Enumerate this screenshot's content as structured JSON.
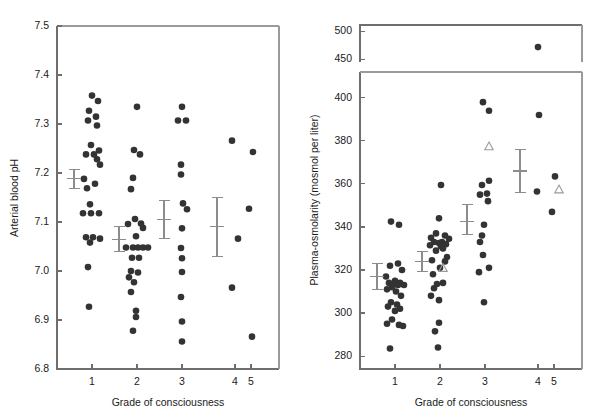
{
  "figure": {
    "panels": [
      "arterial-blood-ph",
      "plasma-osmolarity"
    ]
  },
  "chart_data": [
    {
      "type": "scatter",
      "id": "arterial-blood-ph",
      "title": "",
      "xlabel": "Grade of consciousness",
      "ylabel": "Arterial blood pH",
      "xlim": [
        0.45,
        5.75
      ],
      "ylim": [
        6.8,
        7.5
      ],
      "grid": false,
      "legend": null,
      "x_ticks": [
        1,
        2,
        3,
        4,
        5
      ],
      "x_ticklabels": [
        "1",
        "2",
        "3",
        "4",
        "5"
      ],
      "y_ticks": [
        6.8,
        6.9,
        7.0,
        7.1,
        7.2,
        7.3,
        7.4,
        7.5
      ],
      "y_ticklabels": [
        "6.8",
        "6.9",
        "7.0",
        "7.1",
        "7.2",
        "7.3",
        "7.4",
        "7.5"
      ],
      "series": [
        {
          "name": "Grade 1",
          "marker": "filled-circle",
          "x": 1,
          "values": [
            7.358,
            7.347,
            7.327,
            7.315,
            7.307,
            7.297,
            7.257,
            7.246,
            7.238,
            7.238,
            7.228,
            7.217,
            7.188,
            7.178,
            7.169,
            7.136,
            7.118,
            7.118,
            7.118,
            7.069,
            7.069,
            7.066,
            7.058,
            7.008,
            6.927
          ]
        },
        {
          "name": "Grade 2",
          "marker": "filled-circle",
          "x": 2,
          "values": [
            7.335,
            7.247,
            7.238,
            7.19,
            7.167,
            7.106,
            7.097,
            7.096,
            7.088,
            7.071,
            7.048,
            7.048,
            7.048,
            7.048,
            7.048,
            7.027,
            7.027,
            7.0,
            6.997,
            6.987,
            6.977,
            6.957,
            6.919,
            6.906,
            6.878
          ]
        },
        {
          "name": "Grade 3",
          "marker": "filled-circle",
          "x": 3,
          "values": [
            7.335,
            7.307,
            7.307,
            7.217,
            7.197,
            7.138,
            7.126,
            7.087,
            7.047,
            7.026,
            6.998,
            6.947,
            6.897,
            6.856
          ]
        },
        {
          "name": "Grade 4",
          "marker": "filled-circle",
          "x": 4,
          "values": [
            7.266,
            7.066,
            6.966
          ]
        },
        {
          "name": "Grade 5",
          "marker": "filled-circle",
          "x": 5,
          "values": [
            7.243,
            7.127,
            6.866
          ]
        }
      ],
      "error_bars": [
        {
          "x": 1,
          "mean": 7.188,
          "low": 7.168,
          "high": 7.208
        },
        {
          "x": 2,
          "mean": 7.064,
          "low": 7.04,
          "high": 7.09
        },
        {
          "x": 3,
          "mean": 7.105,
          "low": 7.067,
          "high": 7.144
        },
        {
          "x": 4,
          "mean": 7.09,
          "low": 7.03,
          "high": 7.15
        }
      ]
    },
    {
      "type": "scatter",
      "id": "plasma-osmolarity",
      "title": "",
      "xlabel": "Grade of consciousness",
      "ylabel": "Plasma-osmolarity (mosmol per liter)",
      "xlim": [
        0.45,
        5.75
      ],
      "ylim": [
        274,
        412
      ],
      "ylim_upper": [
        445,
        512
      ],
      "axis_break": true,
      "grid": false,
      "legend": null,
      "x_ticks": [
        1,
        2,
        3,
        4,
        5
      ],
      "x_ticklabels": [
        "1",
        "2",
        "3",
        "4",
        "5"
      ],
      "y_ticks": [
        280,
        300,
        320,
        340,
        360,
        380,
        400
      ],
      "y_ticklabels": [
        "280",
        "300",
        "320",
        "340",
        "360",
        "380",
        "400"
      ],
      "y_ticks_upper": [
        450,
        500
      ],
      "y_ticklabels_upper": [
        "450",
        "500"
      ],
      "series": [
        {
          "name": "Grade 1",
          "marker": "filled-circle",
          "x": 1,
          "values": [
            342.5,
            341,
            323,
            322,
            320,
            317,
            315,
            314,
            314,
            313,
            313,
            313,
            312,
            311,
            310,
            308,
            305,
            304,
            303,
            302,
            301,
            297,
            295,
            294.5,
            294,
            283.5
          ]
        },
        {
          "name": "Grade 2",
          "marker": "filled-circle",
          "x": 2,
          "values": [
            359.5,
            344,
            337,
            336,
            335,
            334.5,
            333,
            333,
            332.5,
            332,
            331.5,
            331,
            330,
            329,
            326,
            324.5,
            324,
            321,
            318,
            314,
            313.5,
            311.5,
            308,
            306,
            295.5,
            291.5,
            284
          ]
        },
        {
          "name": "Grade 3",
          "marker": "filled-circle",
          "x": 3,
          "values": [
            398,
            394,
            361.5,
            359.5,
            355.5,
            355,
            352,
            341,
            336,
            333,
            327,
            321,
            319,
            305
          ]
        },
        {
          "name": "Grade 4",
          "marker": "filled-circle",
          "x": 4,
          "values": [
            472,
            392,
            356.5
          ]
        },
        {
          "name": "Grade 5",
          "marker": "filled-circle",
          "x": 5,
          "values": [
            363.5,
            347
          ]
        },
        {
          "name": "Triangle markers",
          "marker": "open-triangle",
          "points": [
            {
              "x": 2,
              "y": 321
            },
            {
              "x": 3,
              "y": 377.5
            },
            {
              "x": 5,
              "y": 357.5
            }
          ]
        }
      ],
      "error_bars": [
        {
          "x": 1,
          "mean": 317,
          "low": 311,
          "high": 323
        },
        {
          "x": 2,
          "mean": 324,
          "low": 319.5,
          "high": 328.5
        },
        {
          "x": 3,
          "mean": 342.5,
          "low": 336.5,
          "high": 350.5
        },
        {
          "x": 4,
          "mean": 366,
          "low": 356,
          "high": 376
        }
      ]
    }
  ]
}
